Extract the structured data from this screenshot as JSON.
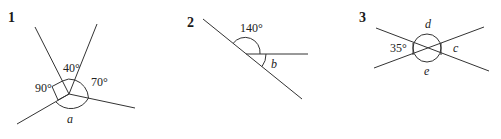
{
  "diagrams": [
    {
      "number": "1",
      "angles": {
        "top": "40°",
        "right": "70°",
        "left": "90°",
        "bottom": "a"
      }
    },
    {
      "number": "2",
      "angles": {
        "top": "140°",
        "bottom": "b"
      }
    },
    {
      "number": "3",
      "angles": {
        "left": "35°",
        "top": "d",
        "right": "c",
        "bottom": "e"
      }
    }
  ]
}
